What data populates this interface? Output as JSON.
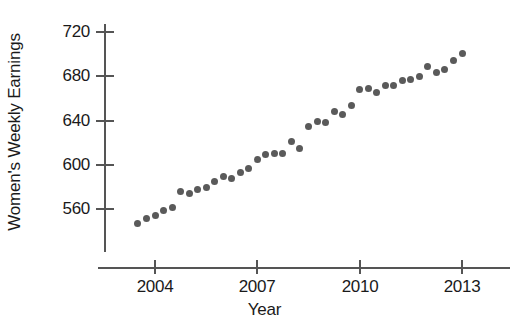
{
  "chart_data": {
    "type": "scatter",
    "title": "",
    "xlabel": "Year",
    "ylabel": "Women's Weekly Earnings",
    "xlim": [
      2003.2,
      2013.6
    ],
    "ylim": [
      538,
      732
    ],
    "grid": false,
    "legend": "none",
    "marker": {
      "shape": "circle",
      "color": "#5a5a5a",
      "size": 7
    },
    "axis_color": "#555555",
    "text_color": "#1a1a1a",
    "background": "#ffffff",
    "xticks": [
      2004,
      2007,
      2010,
      2013
    ],
    "xtick_labels": [
      "2004",
      "2007",
      "2010",
      "2013"
    ],
    "yticks": [
      560,
      600,
      640,
      680,
      720
    ],
    "ytick_labels": [
      "560",
      "600",
      "640",
      "680",
      "720"
    ],
    "x": [
      2003.5,
      2003.75,
      2004.0,
      2004.25,
      2004.5,
      2004.75,
      2005.0,
      2005.25,
      2005.5,
      2005.75,
      2006.0,
      2006.25,
      2006.5,
      2006.75,
      2007.0,
      2007.25,
      2007.5,
      2007.75,
      2008.0,
      2008.25,
      2008.5,
      2008.75,
      2009.0,
      2009.25,
      2009.5,
      2009.75,
      2010.0,
      2010.25,
      2010.5,
      2010.75,
      2011.0,
      2011.25,
      2011.5,
      2011.75,
      2012.0,
      2012.25,
      2012.5,
      2012.75,
      2013.0
    ],
    "y": [
      547,
      551,
      554,
      559,
      561,
      576,
      574,
      578,
      579,
      585,
      589,
      588,
      593,
      597,
      605,
      609,
      610,
      610,
      621,
      615,
      635,
      639,
      638,
      648,
      645,
      654,
      668,
      669,
      665,
      672,
      672,
      676,
      677,
      680,
      689,
      683,
      686,
      694,
      701
    ],
    "points": [
      {
        "x": 2003.5,
        "y": 547
      },
      {
        "x": 2003.75,
        "y": 551
      },
      {
        "x": 2004.0,
        "y": 554
      },
      {
        "x": 2004.25,
        "y": 559
      },
      {
        "x": 2004.5,
        "y": 561
      },
      {
        "x": 2004.75,
        "y": 576
      },
      {
        "x": 2005.0,
        "y": 574
      },
      {
        "x": 2005.25,
        "y": 578
      },
      {
        "x": 2005.5,
        "y": 579
      },
      {
        "x": 2005.75,
        "y": 585
      },
      {
        "x": 2006.0,
        "y": 589
      },
      {
        "x": 2006.25,
        "y": 588
      },
      {
        "x": 2006.5,
        "y": 593
      },
      {
        "x": 2006.75,
        "y": 597
      },
      {
        "x": 2007.0,
        "y": 605
      },
      {
        "x": 2007.25,
        "y": 609
      },
      {
        "x": 2007.5,
        "y": 610
      },
      {
        "x": 2007.75,
        "y": 610
      },
      {
        "x": 2008.0,
        "y": 621
      },
      {
        "x": 2008.25,
        "y": 615
      },
      {
        "x": 2008.5,
        "y": 635
      },
      {
        "x": 2008.75,
        "y": 639
      },
      {
        "x": 2009.0,
        "y": 638
      },
      {
        "x": 2009.25,
        "y": 648
      },
      {
        "x": 2009.5,
        "y": 645
      },
      {
        "x": 2009.75,
        "y": 654
      },
      {
        "x": 2010.0,
        "y": 668
      },
      {
        "x": 2010.25,
        "y": 669
      },
      {
        "x": 2010.5,
        "y": 665
      },
      {
        "x": 2010.75,
        "y": 672
      },
      {
        "x": 2011.0,
        "y": 672
      },
      {
        "x": 2011.25,
        "y": 676
      },
      {
        "x": 2011.5,
        "y": 677
      },
      {
        "x": 2011.75,
        "y": 680
      },
      {
        "x": 2012.0,
        "y": 689
      },
      {
        "x": 2012.25,
        "y": 683
      },
      {
        "x": 2012.5,
        "y": 686
      },
      {
        "x": 2012.75,
        "y": 694
      },
      {
        "x": 2013.0,
        "y": 701
      }
    ]
  }
}
